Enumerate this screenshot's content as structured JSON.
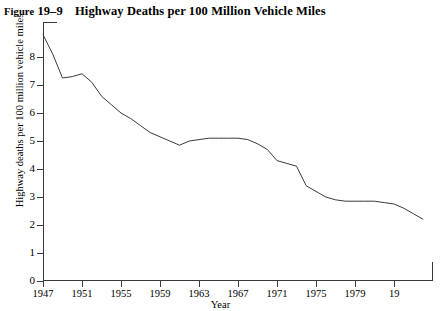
{
  "figure": {
    "label_word": "Figure",
    "number": "19–9",
    "title": "Highway Deaths per 100 Million Vehicle Miles"
  },
  "chart_data": {
    "type": "line",
    "title": "Highway Deaths per 100 Million Vehicle Miles",
    "xlabel": "Year",
    "ylabel": "Highway deaths per 100 million vehicle miles",
    "xlim": [
      1947,
      1987
    ],
    "ylim": [
      0,
      8.6
    ],
    "grid": false,
    "legend": null,
    "line_color": "#3a3a3a",
    "x_tick_labels": [
      "1947",
      "1951",
      "1955",
      "1959",
      "1963",
      "1967",
      "1971",
      "1975",
      "1979",
      "19"
    ],
    "x_tick_values": [
      1947,
      1951,
      1955,
      1959,
      1963,
      1967,
      1971,
      1975,
      1979,
      1983
    ],
    "y_tick_labels": [
      "0",
      "1",
      "2",
      "3",
      "4",
      "5",
      "6",
      "7",
      "8"
    ],
    "y_tick_values": [
      0,
      1,
      2,
      3,
      4,
      5,
      6,
      7,
      8
    ],
    "x": [
      1947,
      1948,
      1949,
      1950,
      1951,
      1952,
      1953,
      1954,
      1955,
      1956,
      1957,
      1958,
      1959,
      1960,
      1961,
      1962,
      1963,
      1964,
      1965,
      1966,
      1967,
      1968,
      1969,
      1970,
      1971,
      1972,
      1973,
      1974,
      1975,
      1976,
      1977,
      1978,
      1979,
      1980,
      1981,
      1982,
      1983,
      1984,
      1985,
      1986
    ],
    "values": [
      8.8,
      8.1,
      7.25,
      7.3,
      7.4,
      7.1,
      6.6,
      6.3,
      6.0,
      5.8,
      5.55,
      5.3,
      5.15,
      5.0,
      4.85,
      5.0,
      5.05,
      5.1,
      5.1,
      5.1,
      5.1,
      5.05,
      4.9,
      4.7,
      4.3,
      4.2,
      4.1,
      3.4,
      3.2,
      3.0,
      2.9,
      2.85,
      2.85,
      2.85,
      2.85,
      2.8,
      2.75,
      2.6,
      2.4,
      2.2
    ]
  }
}
